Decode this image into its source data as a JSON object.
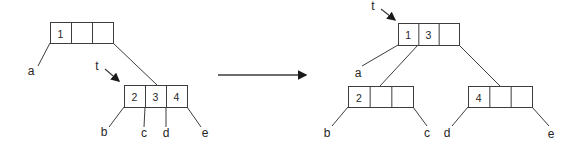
{
  "figure": {
    "colors": {
      "line": "#3d3d3d",
      "text": "#262626",
      "arrowhead": "#1a1a1a",
      "background": "#ffffff",
      "node_fill": "#ffffff"
    },
    "canvas": {
      "width": 583,
      "height": 150
    },
    "cell_font_size": 10.5,
    "label_font_size": 12
  },
  "transform_arrow": {
    "x1": 218,
    "y1": 75,
    "x2": 306,
    "y2": 75
  },
  "diagrams": [
    {
      "name": "before",
      "nodes": [
        {
          "name": "root-node-before",
          "x": 50,
          "y": 22,
          "w": 63,
          "h": 21,
          "cells": [
            "1",
            "",
            ""
          ]
        },
        {
          "name": "leaf-node-234",
          "x": 124,
          "y": 85,
          "w": 63,
          "h": 22,
          "cells": [
            "2",
            "3",
            "4"
          ]
        }
      ],
      "edges": [
        {
          "x1": 50,
          "y1": 43,
          "x2": 38,
          "y2": 66
        },
        {
          "x1": 113,
          "y1": 43,
          "x2": 157,
          "y2": 85
        },
        {
          "x1": 124,
          "y1": 107,
          "x2": 109,
          "y2": 127
        },
        {
          "x1": 145,
          "y1": 107,
          "x2": 144,
          "y2": 127
        },
        {
          "x1": 166,
          "y1": 107,
          "x2": 166,
          "y2": 127
        },
        {
          "x1": 187,
          "y1": 107,
          "x2": 201,
          "y2": 127
        }
      ],
      "labels": [
        {
          "text": "a",
          "x": 31,
          "y": 71
        },
        {
          "text": "b",
          "x": 104,
          "y": 132
        },
        {
          "text": "c",
          "x": 144,
          "y": 133
        },
        {
          "text": "d",
          "x": 166,
          "y": 133
        },
        {
          "text": "e",
          "x": 205,
          "y": 133
        }
      ],
      "pointer": {
        "text": "t",
        "x": 97,
        "y": 66,
        "arrow": {
          "x1": 105,
          "y1": 69,
          "x2": 119,
          "y2": 81
        }
      }
    },
    {
      "name": "after",
      "nodes": [
        {
          "name": "root-node-after",
          "x": 398,
          "y": 23,
          "w": 61,
          "h": 22,
          "cells": [
            "1",
            "3",
            ""
          ]
        },
        {
          "name": "leaf-node-2",
          "x": 348,
          "y": 86,
          "w": 65,
          "h": 21,
          "cells": [
            "2",
            "",
            ""
          ]
        },
        {
          "name": "leaf-node-4",
          "x": 468,
          "y": 86,
          "w": 64,
          "h": 21,
          "cells": [
            "4",
            "",
            ""
          ]
        }
      ],
      "edges": [
        {
          "x1": 398,
          "y1": 45,
          "x2": 362,
          "y2": 66
        },
        {
          "x1": 418,
          "y1": 45,
          "x2": 380,
          "y2": 86
        },
        {
          "x1": 459,
          "y1": 45,
          "x2": 500,
          "y2": 86
        },
        {
          "x1": 348,
          "y1": 107,
          "x2": 332,
          "y2": 126
        },
        {
          "x1": 413,
          "y1": 107,
          "x2": 427,
          "y2": 126
        },
        {
          "x1": 468,
          "y1": 107,
          "x2": 452,
          "y2": 126
        },
        {
          "x1": 532,
          "y1": 107,
          "x2": 549,
          "y2": 126
        }
      ],
      "labels": [
        {
          "text": "a",
          "x": 358,
          "y": 73
        },
        {
          "text": "b",
          "x": 327,
          "y": 133
        },
        {
          "text": "c",
          "x": 427,
          "y": 133
        },
        {
          "text": "d",
          "x": 447,
          "y": 133
        },
        {
          "text": "e",
          "x": 551,
          "y": 134
        }
      ],
      "pointer": {
        "text": "t",
        "x": 373,
        "y": 6,
        "arrow": {
          "x1": 381,
          "y1": 9,
          "x2": 395,
          "y2": 20
        }
      }
    }
  ]
}
